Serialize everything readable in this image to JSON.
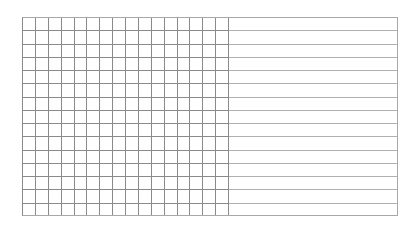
{
  "table": {
    "narrow_columns": 16,
    "wide_columns": 1,
    "rows": 15,
    "cells": [],
    "colors": {
      "grid_line_dark": "#8a8a8a",
      "grid_line_light": "#b0b0b0",
      "background": "#ffffff"
    }
  }
}
